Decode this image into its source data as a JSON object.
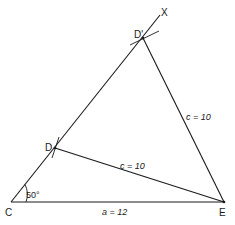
{
  "diagram": {
    "type": "geometric-construction",
    "points": {
      "C": {
        "label": "C",
        "x": 11,
        "y": 202
      },
      "E": {
        "label": "E",
        "x": 224,
        "y": 202
      },
      "D": {
        "label": "D",
        "x": 55,
        "y": 148
      },
      "D_prime": {
        "label": "D'",
        "x": 143,
        "y": 38
      },
      "X": {
        "label": "X",
        "x": 160,
        "y": 15
      }
    },
    "labels": {
      "angle_C": "50°",
      "side_CE": "a = 12",
      "side_DE": "c = 10",
      "side_DprimeE": "c = 10"
    },
    "colors": {
      "line": "#1a1a1a",
      "background": "#ffffff"
    }
  }
}
